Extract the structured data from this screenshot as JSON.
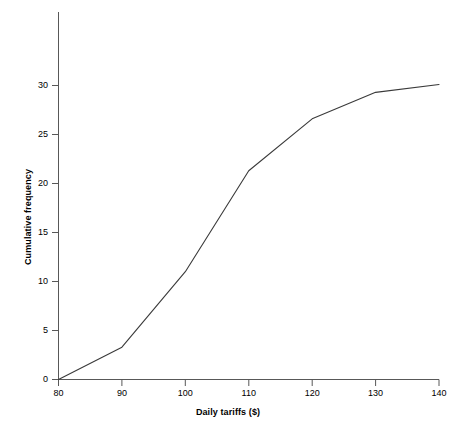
{
  "chart_data": {
    "type": "line",
    "title": "",
    "xlabel": "Daily tariffs ($)",
    "ylabel": "Cumulative frequency",
    "xlim": [
      80,
      140
    ],
    "ylim": [
      0,
      33.5
    ],
    "xticks": [
      80,
      90,
      100,
      110,
      120,
      130,
      140
    ],
    "xtick_labels": [
      "80",
      "90",
      "100",
      "110",
      "120",
      "130",
      "140"
    ],
    "yticks": [
      0,
      5,
      10,
      15,
      20,
      25,
      30
    ],
    "ytick_labels": [
      "0",
      "5",
      "10",
      "15",
      "20",
      "25",
      "30"
    ],
    "grid": false,
    "legend": null,
    "line_color": "#3a3a3a",
    "series": [
      {
        "name": "Cumulative frequency",
        "x": [
          80,
          90,
          100,
          110,
          120,
          130,
          140
        ],
        "values": [
          0,
          3.3,
          11.0,
          21.3,
          26.6,
          29.3,
          30.1
        ]
      }
    ]
  }
}
